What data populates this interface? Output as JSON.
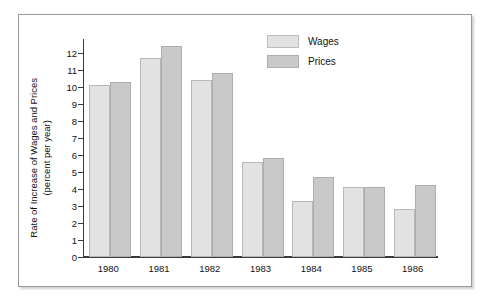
{
  "chart_data": {
    "type": "bar",
    "title": "",
    "xlabel": "",
    "ylabel": "Rate of Increase of Wages and Prices (percent per year)",
    "ylabel_line1": "Rate of Increase of Wages and Prices",
    "ylabel_line2": "(percent per year)",
    "categories": [
      "1980",
      "1981",
      "1982",
      "1983",
      "1984",
      "1985",
      "1986"
    ],
    "series": [
      {
        "name": "Wages",
        "values": [
          10.1,
          11.7,
          10.4,
          5.6,
          3.3,
          4.1,
          2.8
        ],
        "color": "#e2e2e2"
      },
      {
        "name": "Prices",
        "values": [
          10.3,
          12.4,
          10.8,
          5.8,
          4.7,
          4.1,
          4.2
        ],
        "color": "#c9c9c9"
      }
    ],
    "ylim": [
      0,
      12.8
    ],
    "yticks": [
      0,
      1,
      2,
      3,
      4,
      5,
      6,
      7,
      8,
      9,
      10,
      11,
      12
    ],
    "ytick_labels": [
      "0",
      "1",
      "2",
      "3",
      "4",
      "5",
      "6",
      "7",
      "8",
      "9",
      "10",
      "11",
      "12"
    ],
    "grid": false,
    "legend_position": "top-right",
    "legend": [
      {
        "label": "Wages",
        "color": "#e2e2e2"
      },
      {
        "label": "Prices",
        "color": "#c9c9c9"
      }
    ]
  }
}
